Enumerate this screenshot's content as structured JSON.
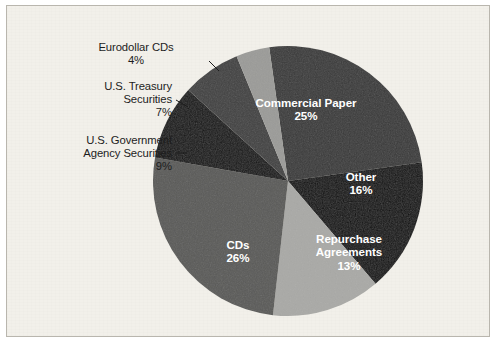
{
  "chart_data": {
    "type": "pie",
    "title": "",
    "subtitle": "",
    "categories": [
      "Commercial Paper",
      "Other",
      "Repurchase Agreements",
      "CDs",
      "U.S. Government Agency Securities",
      "U.S. Treasury Securities",
      "Eurodollar CDs"
    ],
    "values": [
      25,
      16,
      13,
      26,
      9,
      7,
      4
    ],
    "unit": "%",
    "legend": "none",
    "grid": false,
    "slices": [
      {
        "label": "Commercial Paper",
        "value": 25,
        "percent_text": "25%",
        "color": "#3a3a3a",
        "label_placement": "inside",
        "label_color": "#ffffff"
      },
      {
        "label": "Other",
        "value": 16,
        "percent_text": "16%",
        "color": "#0e0e0e",
        "label_placement": "inside",
        "label_color": "#ffffff"
      },
      {
        "label": "Repurchase Agreements",
        "value": 13,
        "percent_text": "13%",
        "color": "#a9a9a6",
        "label_placement": "inside",
        "label_color": "#ffffff"
      },
      {
        "label": "CDs",
        "value": 26,
        "percent_text": "26%",
        "color": "#5a5a58",
        "label_placement": "inside",
        "label_color": "#ffffff"
      },
      {
        "label": "U.S. Government Agency Securities",
        "value": 9,
        "percent_text": "9%",
        "color": "#141414",
        "label_placement": "outside",
        "label_color": "#1d1d1d"
      },
      {
        "label": "U.S. Treasury Securities",
        "value": 7,
        "percent_text": "7%",
        "color": "#414141",
        "label_placement": "outside",
        "label_color": "#1d1d1d"
      },
      {
        "label": "Eurodollar CDs",
        "value": 4,
        "percent_text": "4%",
        "color": "#9b9b98",
        "label_placement": "outside",
        "label_color": "#1d1d1d"
      }
    ]
  },
  "labels": {
    "commercial_paper": {
      "name": "Commercial Paper",
      "pct": "25%"
    },
    "other": {
      "name": "Other",
      "pct": "16%"
    },
    "repurchase_agreements": {
      "name_line1": "Repurchase",
      "name_line2": "Agreements",
      "pct": "13%"
    },
    "cds": {
      "name": "CDs",
      "pct": "26%"
    },
    "us_govt_agency": {
      "name_line1": "U.S. Government",
      "name_line2": "Agency Securities",
      "pct": "9%"
    },
    "us_treasury": {
      "name_line1": "U.S. Treasury",
      "name_line2": "Securities",
      "pct": "7%"
    },
    "eurodollar_cds": {
      "name": "Eurodollar CDs",
      "pct": "4%"
    }
  },
  "figure": {
    "background_color": "#f2f0ea",
    "border_color": "#b9b6ae",
    "center_x": 288,
    "center_y": 181,
    "radius": 135
  }
}
